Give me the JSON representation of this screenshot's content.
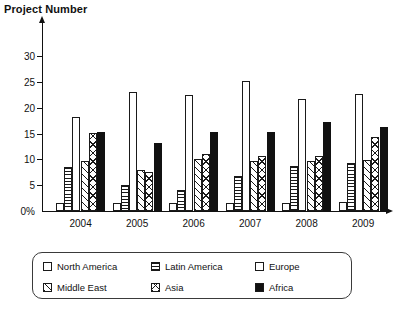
{
  "chart_data": {
    "type": "bar",
    "title": "Project Number",
    "xlabel": "",
    "ylabel": "",
    "ylim": [
      0,
      32
    ],
    "yticks": [
      0,
      5,
      10,
      15,
      20,
      25,
      30
    ],
    "ytick_labels": [
      "0%",
      "5",
      "10",
      "15",
      "20",
      "25",
      "30"
    ],
    "grid": false,
    "legend_position": "bottom",
    "categories": [
      "2004",
      "2005",
      "2006",
      "2007",
      "2008",
      "2009"
    ],
    "series": [
      {
        "name": "North America",
        "pattern": "plain",
        "values": [
          1.5,
          1.5,
          1.6,
          1.6,
          1.6,
          1.7
        ]
      },
      {
        "name": "Latin America",
        "pattern": "hlines",
        "values": [
          8.5,
          5.1,
          4.1,
          6.7,
          8.8,
          9.3
        ]
      },
      {
        "name": "Europe",
        "pattern": "plain",
        "values": [
          18.1,
          23.0,
          22.5,
          25.2,
          21.6,
          22.7
        ]
      },
      {
        "name": "Middle East",
        "pattern": "diag",
        "values": [
          9.6,
          8.0,
          10.1,
          9.6,
          9.7,
          9.8
        ]
      },
      {
        "name": "Asia",
        "pattern": "cross",
        "values": [
          15.1,
          7.6,
          11.0,
          10.6,
          10.6,
          14.3
        ]
      },
      {
        "name": "Africa",
        "pattern": "solid",
        "values": [
          15.2,
          13.2,
          15.2,
          15.3,
          17.3,
          16.3
        ]
      }
    ]
  },
  "legend": {
    "items": [
      {
        "label": "North America",
        "pattern": "plain"
      },
      {
        "label": "Latin America",
        "pattern": "hlines"
      },
      {
        "label": "Europe",
        "pattern": "plain"
      },
      {
        "label": "Middle East",
        "pattern": "diag"
      },
      {
        "label": "Asia",
        "pattern": "cross"
      },
      {
        "label": "Africa",
        "pattern": "solid"
      }
    ]
  },
  "colors": {
    "ink": "#111111",
    "background": "#ffffff",
    "solid_fill": "#111111"
  }
}
